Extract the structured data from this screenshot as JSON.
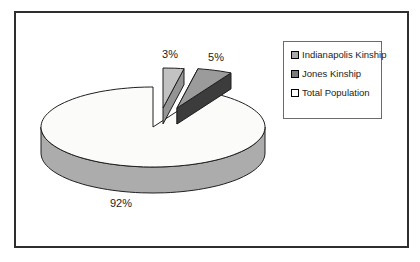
{
  "chart_data": {
    "type": "pie",
    "style": "3d-pie-exploded",
    "title": "",
    "categories": [
      "Indianapolis Kinship",
      "Jones Kinship",
      "Total Population"
    ],
    "values": [
      3,
      5,
      92
    ],
    "slices": [
      {
        "label": "Indianapolis Kinship",
        "value": 3,
        "display": "3%",
        "color_top": "#C2C2C2",
        "color_side": "#949494",
        "legend_color": "#A9A9A9",
        "exploded": true
      },
      {
        "label": "Jones Kinship",
        "value": 5,
        "display": "5%",
        "color_top": "#9B9B9B",
        "color_side": "#3C3C3C",
        "legend_color": "#7B7B7B",
        "exploded": true
      },
      {
        "label": "Total Population",
        "value": 92,
        "display": "92%",
        "color_top": "#FBFBF9",
        "color_side": "#ACACAC",
        "legend_color": "#FFFFFF",
        "exploded": false
      }
    ],
    "legend": {
      "position": "right",
      "entries": [
        "Indianapolis Kinship",
        "Jones Kinship",
        "Total Population"
      ]
    },
    "layout": {
      "start_angle_deg": 90,
      "direction": "clockwise",
      "center": [
        153,
        127
      ],
      "rx": 112,
      "ry": 40,
      "depth": 26,
      "explode_offsets": [
        [
          10,
          -19
        ],
        [
          24,
          -19
        ],
        [
          0,
          0
        ]
      ],
      "explode_depth": 16,
      "label_positions": [
        [
          170,
          58
        ],
        [
          216,
          61
        ],
        [
          121,
          207
        ]
      ],
      "outline_color": "#1f1f1f"
    }
  }
}
